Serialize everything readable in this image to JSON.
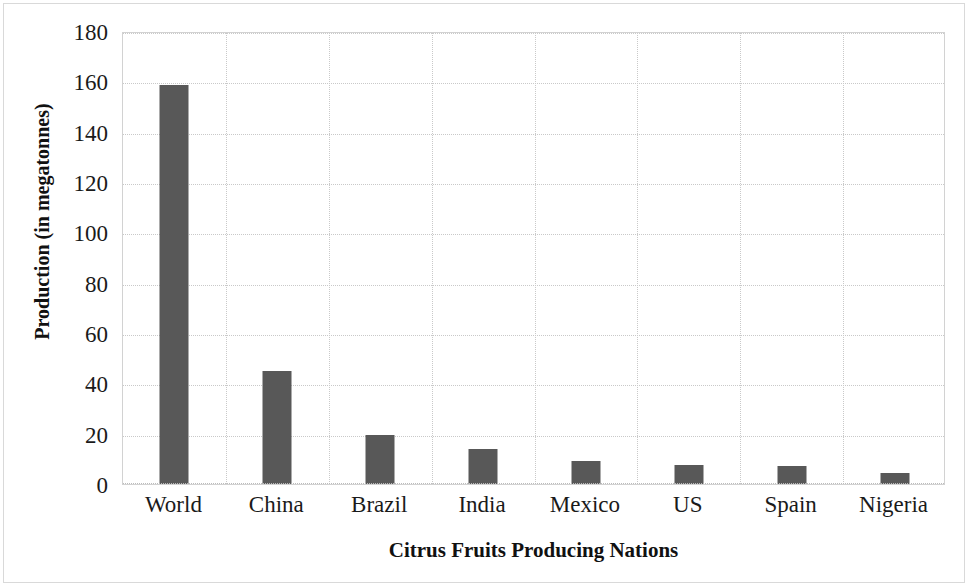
{
  "chart_data": {
    "type": "bar",
    "title": "",
    "xlabel": "Citrus Fruits Producing Nations",
    "ylabel": "Production (in megatonnes)",
    "categories": [
      "World",
      "China",
      "Brazil",
      "India",
      "Mexico",
      "US",
      "Spain",
      "Nigeria"
    ],
    "values": [
      158.5,
      44.8,
      19.5,
      14.0,
      9.2,
      7.5,
      7.0,
      4.3
    ],
    "ylim": [
      0,
      180
    ],
    "ytick_labels": [
      "180",
      "160",
      "140",
      "120",
      "100",
      "80",
      "60",
      "40",
      "20",
      "0"
    ],
    "ytick_values": [
      180,
      160,
      140,
      120,
      100,
      80,
      60,
      40,
      20,
      0
    ],
    "ytick_step": 20,
    "grid": "horizontal-and-vertical-dotted",
    "legend": "none",
    "bar_color": "#585858",
    "grid_color": "#c9c9c9",
    "plot_border_color": "#d2d2d2",
    "background_color": "#ffffff"
  }
}
